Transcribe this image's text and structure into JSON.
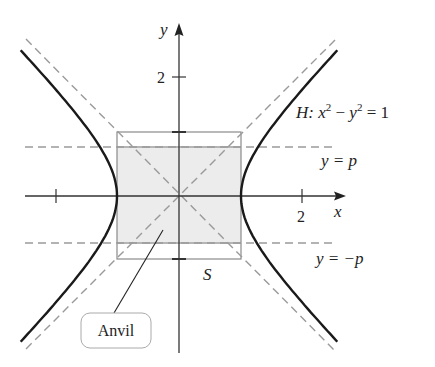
{
  "figure": {
    "curve_label": {
      "prefix": "H: ",
      "x": "x",
      "sup1": "2",
      "minus": " − ",
      "y": "y",
      "sup2": "2",
      "rhs": " = 1"
    },
    "axis_labels": {
      "x": "x",
      "y": "y"
    },
    "ticks": {
      "x_positive": "2",
      "y_positive": "2"
    },
    "line_labels": {
      "upper": "y = p",
      "lower": "y = −p"
    },
    "square_label": "S",
    "callout_label": "Anvil"
  },
  "geometry": {
    "origin_px": [
      179,
      196
    ],
    "unit_px": 62,
    "p": 0.77,
    "y_range": [
      -2.35,
      2.35
    ]
  },
  "colors": {
    "curve": "#1a1a1a",
    "axes": "#333333",
    "dashed": "#9a9a9a",
    "square": "#8a8a8a",
    "band_fill": "#ececec",
    "band_edge": "#b5b5b5"
  }
}
